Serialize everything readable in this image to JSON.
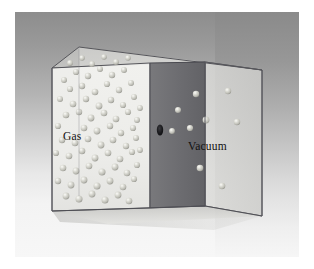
{
  "figure": {
    "background": {
      "plate_top_color": "#8d8d8d",
      "plate_bottom_color": "#f7f7f7",
      "page_color": "#ffffff",
      "margin_px": 14
    },
    "labels": [
      {
        "id": "gas",
        "text": "Gas",
        "chamber": "left",
        "x": 63,
        "y": 130
      },
      {
        "id": "vacuum",
        "text": "Vacuum",
        "chamber": "right",
        "x": 188,
        "y": 140
      }
    ],
    "box": {
      "style": "transparent glass",
      "edge_color": "#4a4a50",
      "face_left_color": "#ededea",
      "face_right_color": "#d9d9d6",
      "face_top_color": "#c9c9c6",
      "floor_color": "#cfcfcc",
      "partition_color": "#6f6f72"
    },
    "partition": {
      "hole_label": "hole",
      "hole_color": "#1d1d20",
      "hole_cx": 160,
      "hole_cy": 130,
      "hole_rx": 3.2,
      "hole_ry": 5.6
    },
    "molecules": {
      "sphere_color": "#c9c9c2",
      "highlight_color": "#f2f2ee",
      "shadow_color": "#8e8e88",
      "gas_count": 74,
      "vacuum_count": 9,
      "gas_points": [
        [
          64,
          80,
          3.0
        ],
        [
          76,
          72,
          3.1
        ],
        [
          88,
          76,
          3.2
        ],
        [
          100,
          69,
          3.0
        ],
        [
          112,
          75,
          3.2
        ],
        [
          124,
          70,
          3.0
        ],
        [
          70,
          89,
          3.1
        ],
        [
          82,
          86,
          3.2
        ],
        [
          95,
          92,
          3.3
        ],
        [
          107,
          84,
          3.1
        ],
        [
          119,
          90,
          3.2
        ],
        [
          131,
          83,
          3.0
        ],
        [
          60,
          99,
          3.0
        ],
        [
          73,
          104,
          3.3
        ],
        [
          86,
          99,
          3.2
        ],
        [
          99,
          106,
          3.4
        ],
        [
          111,
          100,
          3.2
        ],
        [
          123,
          105,
          3.1
        ],
        [
          134,
          97,
          3.0
        ],
        [
          66,
          115,
          3.3
        ],
        [
          79,
          112,
          3.2
        ],
        [
          91,
          118,
          3.4
        ],
        [
          104,
          113,
          3.3
        ],
        [
          116,
          119,
          3.3
        ],
        [
          128,
          112,
          3.1
        ],
        [
          137,
          120,
          3.0
        ],
        [
          58,
          126,
          3.1
        ],
        [
          84,
          128,
          3.3
        ],
        [
          97,
          131,
          3.4
        ],
        [
          110,
          126,
          3.2
        ],
        [
          121,
          133,
          3.2
        ],
        [
          133,
          128,
          3.1
        ],
        [
          62,
          140,
          3.2
        ],
        [
          75,
          143,
          3.3
        ],
        [
          88,
          139,
          3.3
        ],
        [
          101,
          145,
          3.4
        ],
        [
          113,
          140,
          3.3
        ],
        [
          126,
          146,
          3.2
        ],
        [
          136,
          138,
          3.0
        ],
        [
          56,
          153,
          3.1
        ],
        [
          69,
          156,
          3.3
        ],
        [
          82,
          151,
          3.3
        ],
        [
          95,
          158,
          3.4
        ],
        [
          108,
          153,
          3.3
        ],
        [
          120,
          159,
          3.3
        ],
        [
          132,
          152,
          3.1
        ],
        [
          63,
          168,
          3.3
        ],
        [
          76,
          171,
          3.4
        ],
        [
          89,
          166,
          3.3
        ],
        [
          102,
          172,
          3.5
        ],
        [
          115,
          167,
          3.4
        ],
        [
          127,
          173,
          3.3
        ],
        [
          137,
          165,
          3.1
        ],
        [
          58,
          181,
          3.2
        ],
        [
          71,
          185,
          3.4
        ],
        [
          84,
          180,
          3.4
        ],
        [
          97,
          186,
          3.5
        ],
        [
          110,
          181,
          3.4
        ],
        [
          123,
          187,
          3.3
        ],
        [
          134,
          179,
          3.1
        ],
        [
          66,
          196,
          3.4
        ],
        [
          79,
          199,
          3.5
        ],
        [
          92,
          194,
          3.4
        ],
        [
          105,
          200,
          3.5
        ],
        [
          118,
          195,
          3.4
        ],
        [
          129,
          201,
          3.3
        ],
        [
          92,
          64,
          2.9
        ],
        [
          116,
          62,
          2.9
        ],
        [
          104,
          57,
          2.8
        ],
        [
          70,
          63,
          2.9
        ],
        [
          82,
          58,
          2.8
        ],
        [
          128,
          58,
          2.8
        ],
        [
          140,
          108,
          2.9
        ],
        [
          140,
          150,
          2.9
        ]
      ],
      "vacuum_points": [
        [
          196,
          94,
          3.2
        ],
        [
          228,
          91,
          3.2
        ],
        [
          206,
          120,
          3.4
        ],
        [
          178,
          110,
          3.0
        ],
        [
          172,
          131,
          2.9
        ],
        [
          190,
          128,
          3.1
        ],
        [
          237,
          122,
          3.2
        ],
        [
          200,
          168,
          3.3
        ],
        [
          222,
          186,
          3.3
        ]
      ]
    },
    "geometry": {
      "front_top_left": [
        52,
        68
      ],
      "front_top_right": [
        205,
        62
      ],
      "back_top_left": [
        79,
        47
      ],
      "back_top_right": [
        262,
        70
      ],
      "front_bottom_left": [
        52,
        211
      ],
      "front_bottom_right": [
        205,
        206
      ],
      "back_bottom_right": [
        262,
        216
      ],
      "partition_top_front": [
        150,
        63
      ],
      "partition_bottom_front": [
        150,
        208
      ]
    }
  }
}
